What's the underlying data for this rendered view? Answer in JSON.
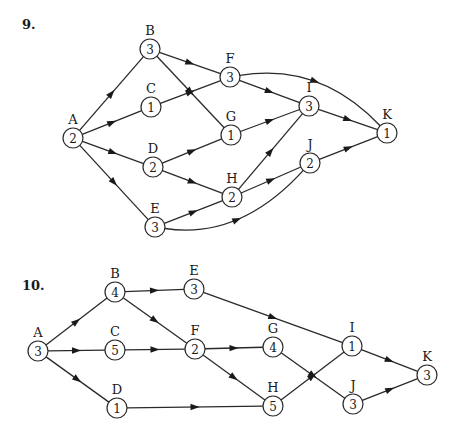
{
  "diagrams": [
    {
      "problem_number": "9.",
      "number_pos": [
        22,
        17
      ],
      "node_radius": 10,
      "nodes": [
        {
          "id": "A",
          "value": "2",
          "x": 73,
          "y": 138
        },
        {
          "id": "B",
          "value": "3",
          "x": 150,
          "y": 49
        },
        {
          "id": "C",
          "value": "1",
          "x": 151,
          "y": 107
        },
        {
          "id": "D",
          "value": "2",
          "x": 153,
          "y": 167
        },
        {
          "id": "E",
          "value": "3",
          "x": 155,
          "y": 227
        },
        {
          "id": "F",
          "value": "3",
          "x": 230,
          "y": 77
        },
        {
          "id": "G",
          "value": "1",
          "x": 231,
          "y": 135
        },
        {
          "id": "H",
          "value": "2",
          "x": 232,
          "y": 197
        },
        {
          "id": "I",
          "value": "3",
          "x": 309,
          "y": 106
        },
        {
          "id": "J",
          "value": "2",
          "x": 310,
          "y": 163
        },
        {
          "id": "K",
          "value": "1",
          "x": 387,
          "y": 133
        }
      ],
      "edges": [
        {
          "from": "A",
          "to": "B"
        },
        {
          "from": "A",
          "to": "C"
        },
        {
          "from": "A",
          "to": "D"
        },
        {
          "from": "A",
          "to": "E"
        },
        {
          "from": "B",
          "to": "F"
        },
        {
          "from": "B",
          "to": "G"
        },
        {
          "from": "C",
          "to": "F"
        },
        {
          "from": "D",
          "to": "G"
        },
        {
          "from": "D",
          "to": "H"
        },
        {
          "from": "E",
          "to": "H"
        },
        {
          "from": "E",
          "to": "J",
          "curve": [
            240,
            240
          ]
        },
        {
          "from": "F",
          "to": "I"
        },
        {
          "from": "F",
          "to": "K",
          "curve": [
            320,
            62
          ]
        },
        {
          "from": "G",
          "to": "I"
        },
        {
          "from": "H",
          "to": "I"
        },
        {
          "from": "H",
          "to": "J"
        },
        {
          "from": "I",
          "to": "K"
        },
        {
          "from": "J",
          "to": "K"
        }
      ]
    },
    {
      "problem_number": "10.",
      "number_pos": [
        22,
        278
      ],
      "node_radius": 10,
      "nodes": [
        {
          "id": "A",
          "value": "3",
          "x": 38,
          "y": 351
        },
        {
          "id": "B",
          "value": "4",
          "x": 115,
          "y": 292
        },
        {
          "id": "C",
          "value": "5",
          "x": 115,
          "y": 350
        },
        {
          "id": "D",
          "value": "1",
          "x": 117,
          "y": 408
        },
        {
          "id": "E",
          "value": "3",
          "x": 194,
          "y": 289
        },
        {
          "id": "F",
          "value": "2",
          "x": 195,
          "y": 349
        },
        {
          "id": "G",
          "value": "4",
          "x": 273,
          "y": 347
        },
        {
          "id": "H",
          "value": "5",
          "x": 273,
          "y": 406
        },
        {
          "id": "I",
          "value": "1",
          "x": 352,
          "y": 346
        },
        {
          "id": "J",
          "value": "3",
          "x": 353,
          "y": 404
        },
        {
          "id": "K",
          "value": "3",
          "x": 427,
          "y": 375
        }
      ],
      "edges": [
        {
          "from": "A",
          "to": "B"
        },
        {
          "from": "A",
          "to": "C"
        },
        {
          "from": "A",
          "to": "D"
        },
        {
          "from": "B",
          "to": "E"
        },
        {
          "from": "B",
          "to": "F"
        },
        {
          "from": "C",
          "to": "F"
        },
        {
          "from": "D",
          "to": "H"
        },
        {
          "from": "E",
          "to": "I"
        },
        {
          "from": "F",
          "to": "G"
        },
        {
          "from": "F",
          "to": "H"
        },
        {
          "from": "G",
          "to": "J"
        },
        {
          "from": "H",
          "to": "I"
        },
        {
          "from": "I",
          "to": "K"
        },
        {
          "from": "J",
          "to": "K"
        }
      ]
    }
  ]
}
